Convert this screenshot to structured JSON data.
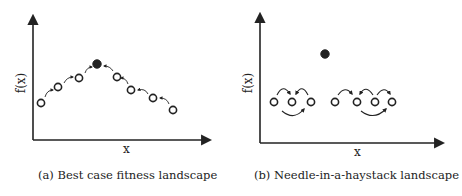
{
  "panels": [
    {
      "id": "a",
      "caption": "(a) Best case fitness landscape",
      "xlabel": "x",
      "ylabel": "f(x)",
      "points": [
        {
          "x": 41,
          "y": 103,
          "filled": false
        },
        {
          "x": 58,
          "y": 87,
          "filled": false
        },
        {
          "x": 79,
          "y": 78,
          "filled": false
        },
        {
          "x": 97,
          "y": 64,
          "filled": true
        },
        {
          "x": 117,
          "y": 77,
          "filled": false
        },
        {
          "x": 131,
          "y": 90,
          "filled": false
        },
        {
          "x": 153,
          "y": 98,
          "filled": false
        },
        {
          "x": 173,
          "y": 110,
          "filled": false
        }
      ]
    },
    {
      "id": "b",
      "caption": "(b) Needle-in-a-haystack landscape",
      "xlabel": "x",
      "ylabel": "f(x)",
      "points": [
        {
          "x": 325,
          "y": 54,
          "filled": true
        },
        {
          "x": 274,
          "y": 102,
          "filled": false
        },
        {
          "x": 292,
          "y": 102,
          "filled": false
        },
        {
          "x": 311,
          "y": 102,
          "filled": false
        },
        {
          "x": 335,
          "y": 102,
          "filled": false
        },
        {
          "x": 357,
          "y": 102,
          "filled": false
        },
        {
          "x": 375,
          "y": 102,
          "filled": false
        },
        {
          "x": 392,
          "y": 102,
          "filled": false
        }
      ]
    }
  ],
  "colors": {
    "ink": "#222222",
    "background": "#ffffff"
  }
}
